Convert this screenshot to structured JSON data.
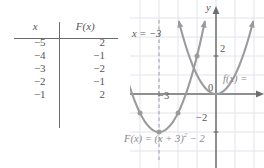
{
  "figure": {
    "kind": "math-figure-table-and-graph",
    "accent_curve_color": "#9b9b9b",
    "axis_color": "#6e6e6e",
    "grid_color": "#e3e3ec",
    "text_color": "#555555"
  },
  "table": {
    "name": "function-value-table",
    "headers": [
      "x",
      "F(x)"
    ],
    "rows": [
      {
        "x": "−5",
        "fx": "2"
      },
      {
        "x": "−4",
        "fx": "−1"
      },
      {
        "x": "−3",
        "fx": "−2"
      },
      {
        "x": "−2",
        "fx": "−1"
      },
      {
        "x": "−1",
        "fx": "2"
      }
    ]
  },
  "graph": {
    "y_axis_label": "y",
    "origin_label": "0",
    "tick_labels": {
      "y_two": "2",
      "y_neg_two": "−2",
      "x_neg_three": "−3"
    },
    "annotations": {
      "axis_of_symmetry": "x = −3",
      "shifted_equation_prefix": "F(x) = (x + 3)",
      "shifted_equation_exponent": "2",
      "shifted_equation_suffix": " − 2",
      "parent_label": "f(x) ="
    }
  },
  "chart_data": {
    "type": "line",
    "title": "",
    "xlabel": "x",
    "ylabel": "y",
    "xlim": [
      -6.2,
      2.5
    ],
    "ylim": [
      -3.2,
      4.2
    ],
    "grid": true,
    "legend": "inline-labels",
    "series": [
      {
        "name": "F(x) = (x + 3)^2 - 2",
        "equation": "F(x) = (x + 3)^2 − 2",
        "vertex": [
          -3,
          -2
        ],
        "axis_of_symmetry": -3,
        "marked_points": [
          {
            "x": -5,
            "y": 2
          },
          {
            "x": -4,
            "y": -1
          },
          {
            "x": -3,
            "y": -2
          },
          {
            "x": -2,
            "y": -1
          },
          {
            "x": -1,
            "y": 2
          }
        ],
        "arrow_ends": [
          [
            -5.4,
            3.8
          ],
          [
            -0.6,
            3.8
          ]
        ]
      },
      {
        "name": "f(x) = x^2",
        "equation": "f(x) = x²",
        "vertex": [
          0,
          0
        ],
        "axis_of_symmetry": 0,
        "marked_points": [],
        "arrow_ends": [
          [
            -1.95,
            3.8
          ],
          [
            1.95,
            3.8
          ]
        ]
      }
    ],
    "annotations": [
      {
        "text": "x = −3",
        "at": [
          -5.4,
          2.9
        ],
        "kind": "dashed-vertical-line-label"
      },
      {
        "text": "F(x) = (x + 3)² − 2",
        "at": [
          -5.9,
          -2.9
        ],
        "kind": "curve-label"
      },
      {
        "text": "f(x) =",
        "at": [
          1.1,
          0.7
        ],
        "kind": "curve-label"
      },
      {
        "text": "2",
        "at": [
          0.18,
          2
        ],
        "kind": "y-tick"
      },
      {
        "text": "−2",
        "at": [
          0.18,
          -2
        ],
        "kind": "y-tick"
      },
      {
        "text": "−3",
        "at": [
          -3,
          -0.45
        ],
        "kind": "x-tick"
      },
      {
        "text": "0",
        "at": [
          0.2,
          -0.45
        ],
        "kind": "origin"
      }
    ]
  }
}
